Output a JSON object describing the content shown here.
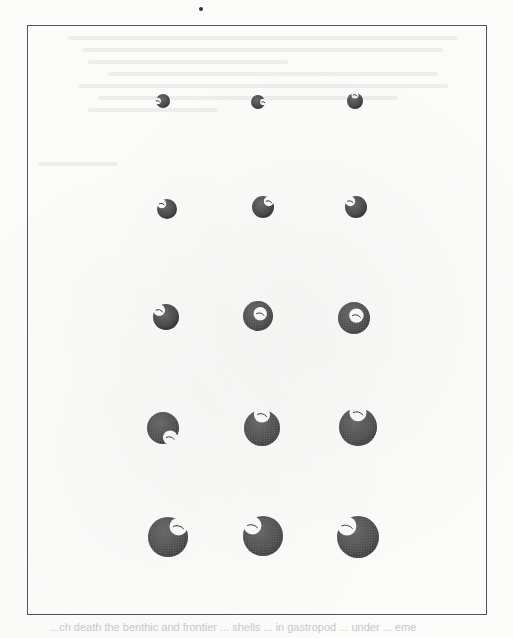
{
  "page": {
    "type": "scanned-paper-figure",
    "background": "#fbfbfa"
  },
  "figure": {
    "frame": {
      "left": 27,
      "top": 25,
      "right": 488,
      "bottom": 616,
      "border_color": "#555555"
    },
    "rows": 5,
    "columns": 3,
    "shell_color": "#4a4a4a",
    "mesh_color": "#6b6b6b",
    "panels": [
      {
        "id": "r1c1",
        "row": 1,
        "col": 1,
        "cx": 163,
        "cy": 101,
        "r": 7,
        "aperture": "left"
      },
      {
        "id": "r1c2",
        "row": 1,
        "col": 2,
        "cx": 258,
        "cy": 102,
        "r": 7,
        "aperture": "right"
      },
      {
        "id": "r1c3",
        "row": 1,
        "col": 3,
        "cx": 355,
        "cy": 101,
        "r": 8,
        "aperture": "top"
      },
      {
        "id": "r2c1",
        "row": 2,
        "col": 1,
        "cx": 167,
        "cy": 209,
        "r": 10,
        "aperture": "top-left"
      },
      {
        "id": "r2c2",
        "row": 2,
        "col": 2,
        "cx": 263,
        "cy": 207,
        "r": 11,
        "aperture": "top-right"
      },
      {
        "id": "r2c3",
        "row": 2,
        "col": 3,
        "cx": 356,
        "cy": 207,
        "r": 11,
        "aperture": "top-left"
      },
      {
        "id": "r3c1",
        "row": 3,
        "col": 1,
        "cx": 166,
        "cy": 317,
        "r": 13,
        "aperture": "top-left"
      },
      {
        "id": "r3c2",
        "row": 3,
        "col": 2,
        "cx": 258,
        "cy": 316,
        "r": 15,
        "aperture": "center"
      },
      {
        "id": "r3c3",
        "row": 3,
        "col": 3,
        "cx": 354,
        "cy": 318,
        "r": 16,
        "aperture": "center"
      },
      {
        "id": "r4c1",
        "row": 4,
        "col": 1,
        "cx": 163,
        "cy": 428,
        "r": 16,
        "aperture": "bottom-right"
      },
      {
        "id": "r4c2",
        "row": 4,
        "col": 2,
        "cx": 262,
        "cy": 428,
        "r": 18,
        "aperture": "top"
      },
      {
        "id": "r4c3",
        "row": 4,
        "col": 3,
        "cx": 358,
        "cy": 427,
        "r": 19,
        "aperture": "top"
      },
      {
        "id": "r5c1",
        "row": 5,
        "col": 1,
        "cx": 168,
        "cy": 537,
        "r": 20,
        "aperture": "top-right"
      },
      {
        "id": "r5c2",
        "row": 5,
        "col": 2,
        "cx": 263,
        "cy": 536,
        "r": 20,
        "aperture": "top-left"
      },
      {
        "id": "r5c3",
        "row": 5,
        "col": 3,
        "cx": 358,
        "cy": 537,
        "r": 21,
        "aperture": "top-left"
      }
    ]
  },
  "top_mark": {
    "x": 201,
    "y": 9
  },
  "caption": {
    "text": "...ch death the benthic and frontier ... shells ... in gastropod ... under ... eme",
    "legible": false
  }
}
